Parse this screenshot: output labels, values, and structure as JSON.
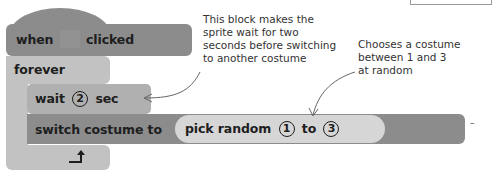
{
  "script": {
    "hat_block": {
      "prefix": "when",
      "icon": "green-flag-icon",
      "suffix": "clicked"
    },
    "forever_block": {
      "label": "forever",
      "loop_icon": "loop-arrow-icon"
    },
    "wait_block": {
      "prefix": "wait",
      "value": "2",
      "suffix": "sec"
    },
    "switch_block": {
      "label": "switch costume to"
    },
    "pick_random_block": {
      "prefix": "pick random",
      "from": "1",
      "middle": "to",
      "to": "3"
    }
  },
  "annotations": {
    "wait_note": [
      "This block makes the",
      "sprite wait for two",
      "seconds before switching",
      "to another costume"
    ],
    "random_note": [
      "Chooses a costume",
      "between 1 and 3",
      "at random"
    ]
  },
  "colors": {
    "hat_block": "#8c8c8c",
    "forever_block": "#c2c2c2",
    "wait_block": "#b0b0b0",
    "switch_block": "#8c8c8c",
    "pick_random_block": "#d6d6d6",
    "arrow": "#666666"
  }
}
